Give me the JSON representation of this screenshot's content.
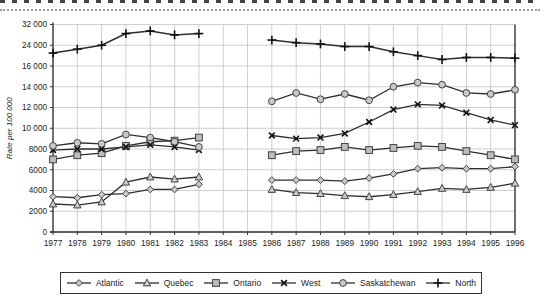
{
  "page": {
    "top_rule_style": "dotted"
  },
  "chart": {
    "ylabel": "Rate per 100 000",
    "colors": {
      "line": "#2e2e2e",
      "grid": "#c3c3c3",
      "axis": "#333333",
      "marker_fill": "#c9c9c9",
      "marker_stroke": "#444444",
      "tick_text": "#222222"
    }
  },
  "chart_data": {
    "type": "line",
    "title": "",
    "xlabel": "",
    "ylabel": "Rate per 100 000",
    "x": [
      1977,
      1978,
      1979,
      1980,
      1981,
      1982,
      1983,
      1984,
      1985,
      1986,
      1987,
      1988,
      1989,
      1990,
      1991,
      1992,
      1993,
      1994,
      1995,
      1996
    ],
    "x_tick_labels": [
      "1977",
      "1978",
      "1979",
      "1980",
      "1981",
      "1982",
      "1983",
      "1984",
      "1985",
      "1986",
      "1987",
      "1988",
      "1989",
      "1990",
      "1991",
      "1992",
      "1993",
      "1994",
      "1995",
      "1996"
    ],
    "y_scale_note": "broken non-linear axis: equal spacing per tick, 2000 steps up to 16000 then 8000 steps",
    "y_ticks": [
      0,
      2000,
      4000,
      6000,
      8000,
      10000,
      12000,
      14000,
      16000,
      24000,
      32000
    ],
    "y_tick_labels": [
      "0",
      "2000",
      "4000",
      "6000",
      "8000",
      "10 000",
      "12 000",
      "14 000",
      "16 000",
      "24 000",
      "32 000"
    ],
    "grid": true,
    "legend_position": "bottom",
    "data_gap_years": [
      1984,
      1985
    ],
    "series": [
      {
        "name": "Atlantic",
        "marker": "diamond",
        "values": [
          3400,
          3300,
          3600,
          3700,
          4100,
          4100,
          4600,
          null,
          null,
          5000,
          5000,
          5000,
          4900,
          5200,
          5600,
          6100,
          6200,
          6100,
          6100,
          6300
        ]
      },
      {
        "name": "Quebec",
        "marker": "triangle",
        "values": [
          2700,
          2600,
          2900,
          4800,
          5300,
          5100,
          5300,
          null,
          null,
          4100,
          3800,
          3700,
          3500,
          3400,
          3600,
          3900,
          4200,
          4100,
          4300,
          4700
        ]
      },
      {
        "name": "Ontario",
        "marker": "square",
        "values": [
          7000,
          7400,
          7600,
          8300,
          8700,
          8800,
          9100,
          null,
          null,
          7400,
          7800,
          7900,
          8200,
          7900,
          8100,
          8300,
          8200,
          7800,
          7400,
          7000
        ]
      },
      {
        "name": "West",
        "marker": "x",
        "values": [
          7900,
          8000,
          8000,
          8200,
          8400,
          8200,
          7900,
          null,
          null,
          9300,
          9000,
          9100,
          9500,
          10600,
          11800,
          12300,
          12200,
          11500,
          10800,
          10300
        ]
      },
      {
        "name": "Saskatchewan",
        "marker": "circle",
        "values": [
          8300,
          8600,
          8500,
          9400,
          9100,
          8700,
          8200,
          null,
          null,
          12600,
          13400,
          12800,
          13300,
          12700,
          14000,
          14400,
          14200,
          13400,
          13300,
          13700
        ]
      },
      {
        "name": "North",
        "marker": "plus",
        "values": [
          21000,
          22500,
          24000,
          28500,
          29500,
          28000,
          28500,
          null,
          null,
          26000,
          25000,
          24500,
          23500,
          23500,
          21500,
          20000,
          18500,
          19300,
          19300,
          19000
        ]
      }
    ]
  },
  "legend": {
    "items": [
      {
        "label": "Atlantic",
        "marker": "diamond"
      },
      {
        "label": "Quebec",
        "marker": "triangle"
      },
      {
        "label": "Ontario",
        "marker": "square"
      },
      {
        "label": "West",
        "marker": "x"
      },
      {
        "label": "Saskatchewan",
        "marker": "circle"
      },
      {
        "label": "North",
        "marker": "plus"
      }
    ]
  }
}
